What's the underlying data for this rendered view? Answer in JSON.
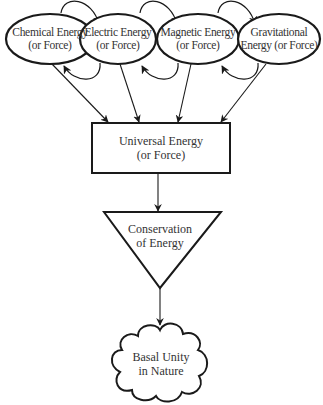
{
  "diagram": {
    "type": "flow",
    "nodes": {
      "chemical": {
        "line1": "Chemical Energy",
        "line2": "(or Force)",
        "shape": "ellipse"
      },
      "electric": {
        "line1": "Electric Energy",
        "line2": "(or Force)",
        "shape": "ellipse"
      },
      "magnetic": {
        "line1": "Magnetic Energy",
        "line2": "(or Force)",
        "shape": "ellipse"
      },
      "gravitational": {
        "line1": "Gravitational",
        "line2": "Energy (or Force)",
        "shape": "ellipse"
      },
      "universal": {
        "line1": "Universal Energy",
        "line2": "(or Force)",
        "shape": "rectangle"
      },
      "conservation": {
        "line1": "Conservation",
        "line2": "of Energy",
        "shape": "inverted-triangle"
      },
      "basal": {
        "line1": "Basal Unity",
        "line2": "in Nature",
        "shape": "cloud"
      }
    },
    "edges": [
      {
        "from": "chemical",
        "to": "electric",
        "style": "curved-top"
      },
      {
        "from": "electric",
        "to": "chemical",
        "style": "curved-bottom"
      },
      {
        "from": "electric",
        "to": "magnetic",
        "style": "curved-top"
      },
      {
        "from": "magnetic",
        "to": "electric",
        "style": "curved-bottom"
      },
      {
        "from": "magnetic",
        "to": "gravitational",
        "style": "curved-top"
      },
      {
        "from": "gravitational",
        "to": "magnetic",
        "style": "curved-bottom"
      },
      {
        "from": "chemical",
        "to": "universal"
      },
      {
        "from": "electric",
        "to": "universal"
      },
      {
        "from": "magnetic",
        "to": "universal"
      },
      {
        "from": "gravitational",
        "to": "universal"
      },
      {
        "from": "universal",
        "to": "conservation"
      },
      {
        "from": "conservation",
        "to": "basal"
      }
    ],
    "colors": {
      "stroke": "#1a1a1a",
      "text": "#333333",
      "background": "#ffffff"
    }
  }
}
